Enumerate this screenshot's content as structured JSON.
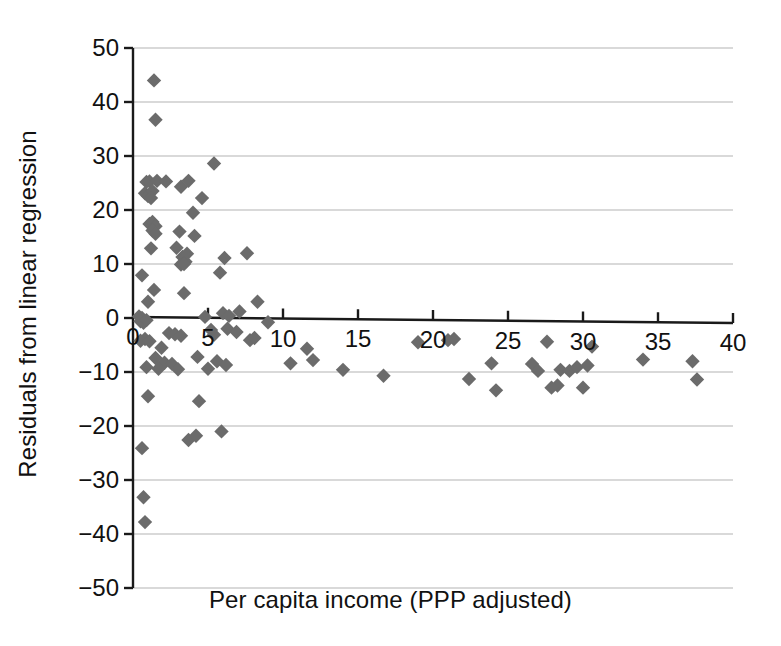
{
  "chart_data": {
    "type": "scatter",
    "title": "",
    "xlabel": "Per capita income (PPP adjusted)",
    "ylabel": "Residuals from linear regression",
    "xlim": [
      0,
      40
    ],
    "ylim": [
      -50,
      50
    ],
    "xticks": [
      0,
      5,
      10,
      15,
      20,
      25,
      30,
      35,
      40
    ],
    "xtick_labels": [
      "0",
      "5",
      "10",
      "15",
      "20",
      "25",
      "30",
      "35",
      "40"
    ],
    "yticks": [
      -50,
      -40,
      -30,
      -20,
      -10,
      0,
      10,
      20,
      30,
      40,
      50
    ],
    "ytick_labels": [
      "-50",
      "-40",
      "-30",
      "-20",
      "-10",
      "0",
      "10",
      "20",
      "30",
      "40",
      "50"
    ],
    "grid": "horizontal",
    "legend": "none",
    "marker": "diamond",
    "marker_color": "#6b6b6b",
    "axis_color": "#1a1a1a",
    "grid_color": "#cccccc",
    "points": [
      [
        1.4,
        44.0
      ],
      [
        1.5,
        36.7
      ],
      [
        0.9,
        25.2
      ],
      [
        1.1,
        25.3
      ],
      [
        1.6,
        25.4
      ],
      [
        2.2,
        25.3
      ],
      [
        0.8,
        23.1
      ],
      [
        1.0,
        22.6
      ],
      [
        1.3,
        23.5
      ],
      [
        1.2,
        22.2
      ],
      [
        4.6,
        22.2
      ],
      [
        3.2,
        24.3
      ],
      [
        5.4,
        28.6
      ],
      [
        3.7,
        25.4
      ],
      [
        1.1,
        17.4
      ],
      [
        1.3,
        17.8
      ],
      [
        1.5,
        17.0
      ],
      [
        1.3,
        16.2
      ],
      [
        1.5,
        15.6
      ],
      [
        4.0,
        19.5
      ],
      [
        3.1,
        16.0
      ],
      [
        1.2,
        12.9
      ],
      [
        2.9,
        13.0
      ],
      [
        4.1,
        15.2
      ],
      [
        3.3,
        11.3
      ],
      [
        3.5,
        10.4
      ],
      [
        3.6,
        11.9
      ],
      [
        6.1,
        11.1
      ],
      [
        3.2,
        9.9
      ],
      [
        3.4,
        10.0
      ],
      [
        5.8,
        8.4
      ],
      [
        0.6,
        7.9
      ],
      [
        1.4,
        5.2
      ],
      [
        3.4,
        4.6
      ],
      [
        7.6,
        12.0
      ],
      [
        1.0,
        3.0
      ],
      [
        8.3,
        3.0
      ],
      [
        0.4,
        0.3
      ],
      [
        0.6,
        0.0
      ],
      [
        0.5,
        -0.6
      ],
      [
        0.7,
        -0.9
      ],
      [
        0.9,
        -0.4
      ],
      [
        4.8,
        0.2
      ],
      [
        6.0,
        0.9
      ],
      [
        6.4,
        0.4
      ],
      [
        7.1,
        1.2
      ],
      [
        9.0,
        -0.8
      ],
      [
        2.4,
        -2.8
      ],
      [
        2.8,
        -3.0
      ],
      [
        3.2,
        -3.3
      ],
      [
        0.8,
        -3.9
      ],
      [
        5.2,
        -2.2
      ],
      [
        5.4,
        -3.1
      ],
      [
        6.3,
        -2.0
      ],
      [
        6.9,
        -2.6
      ],
      [
        0.5,
        -4.2
      ],
      [
        1.1,
        -4.3
      ],
      [
        1.9,
        -5.5
      ],
      [
        7.8,
        -4.1
      ],
      [
        8.1,
        -3.7
      ],
      [
        1.5,
        -7.4
      ],
      [
        2.1,
        -8.3
      ],
      [
        2.6,
        -8.5
      ],
      [
        4.3,
        -7.2
      ],
      [
        5.6,
        -8.0
      ],
      [
        6.2,
        -8.7
      ],
      [
        0.9,
        -9.1
      ],
      [
        1.7,
        -9.4
      ],
      [
        3.0,
        -9.5
      ],
      [
        5.0,
        -9.4
      ],
      [
        11.6,
        -5.7
      ],
      [
        10.5,
        -8.4
      ],
      [
        12.0,
        -7.8
      ],
      [
        1.0,
        -14.5
      ],
      [
        4.4,
        -15.4
      ],
      [
        14.0,
        -9.6
      ],
      [
        16.7,
        -10.7
      ],
      [
        19.0,
        -4.5
      ],
      [
        21.0,
        -4.1
      ],
      [
        21.4,
        -3.9
      ],
      [
        22.4,
        -11.3
      ],
      [
        24.2,
        -13.4
      ],
      [
        23.9,
        -8.4
      ],
      [
        27.6,
        -4.4
      ],
      [
        30.6,
        -5.3
      ],
      [
        26.6,
        -8.5
      ],
      [
        27.0,
        -9.8
      ],
      [
        28.5,
        -9.6
      ],
      [
        29.1,
        -9.8
      ],
      [
        29.6,
        -9.1
      ],
      [
        30.3,
        -8.8
      ],
      [
        30.0,
        -12.9
      ],
      [
        28.3,
        -12.5
      ],
      [
        27.9,
        -12.9
      ],
      [
        34.0,
        -7.7
      ],
      [
        37.3,
        -8.0
      ],
      [
        37.6,
        -11.4
      ],
      [
        0.6,
        -24.1
      ],
      [
        3.7,
        -22.6
      ],
      [
        4.2,
        -21.8
      ],
      [
        5.9,
        -21.0
      ],
      [
        0.7,
        -33.2
      ],
      [
        0.8,
        -37.8
      ]
    ]
  }
}
